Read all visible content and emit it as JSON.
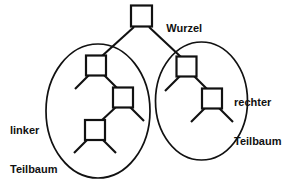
{
  "diagram": {
    "type": "binary-tree-subtree-illustration",
    "language": "de",
    "background_color": "#ffffff",
    "stroke_color": "#111111",
    "labels": {
      "root": "Wurzel",
      "left_subtree_line1": "linker",
      "left_subtree_line2": "Teilbaum",
      "right_subtree_line1": "rechter",
      "right_subtree_line2": "Teilbaum"
    },
    "nodes": [
      {
        "id": "root",
        "label": "",
        "cx": 141.5,
        "cy": 16,
        "size": 21
      },
      {
        "id": "l1",
        "label": "",
        "cx": 96,
        "cy": 65.5,
        "size": 20
      },
      {
        "id": "l2",
        "label": "",
        "cx": 123,
        "cy": 97.5,
        "size": 20
      },
      {
        "id": "l3",
        "label": "",
        "cx": 95,
        "cy": 130,
        "size": 20
      },
      {
        "id": "r1",
        "label": "",
        "cx": 186.5,
        "cy": 66.5,
        "size": 20
      },
      {
        "id": "r2",
        "label": "",
        "cx": 212,
        "cy": 98.5,
        "size": 20
      }
    ],
    "edges": [
      {
        "from": "root",
        "to": "l1"
      },
      {
        "from": "root",
        "to": "r1"
      },
      {
        "from": "l1",
        "to": "l2"
      },
      {
        "from": "l2",
        "to": "l3"
      },
      {
        "from": "r1",
        "to": "r2"
      }
    ],
    "leaf_stubs": [
      {
        "parent": "l1",
        "side": "left"
      },
      {
        "parent": "l2",
        "side": "right"
      },
      {
        "parent": "l3",
        "side": "left"
      },
      {
        "parent": "l3",
        "side": "right"
      },
      {
        "parent": "r1",
        "side": "left"
      },
      {
        "parent": "r2",
        "side": "left"
      },
      {
        "parent": "r2",
        "side": "right"
      }
    ],
    "groupings": [
      {
        "id": "left-subtree-ellipse",
        "cx": 98,
        "cy": 111,
        "rx": 52,
        "ry": 67
      },
      {
        "id": "right-subtree-ellipse",
        "cx": 201.5,
        "cy": 101,
        "rx": 46,
        "ry": 59
      }
    ]
  }
}
